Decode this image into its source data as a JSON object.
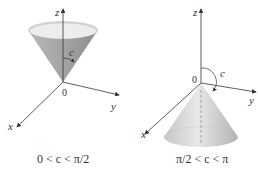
{
  "figures": [
    {
      "id": "left",
      "caption": "0 < c < π/2",
      "axis_labels": {
        "z": "z",
        "y": "y",
        "x": "x",
        "origin": "0"
      },
      "angle_label": "c",
      "description": "Cone opening upward from origin around positive z-axis"
    },
    {
      "id": "right",
      "caption": "π/2 < c < π",
      "axis_labels": {
        "z": "z",
        "y": "y",
        "x": "x",
        "origin": "0"
      },
      "angle_label": "c",
      "description": "Cone opening downward from origin around negative z-axis"
    }
  ],
  "colors": {
    "axis": "#333333",
    "cone_dark": "#9a9a9a",
    "cone_light": "#e6e6e6",
    "rim": "#f0f0f0"
  }
}
